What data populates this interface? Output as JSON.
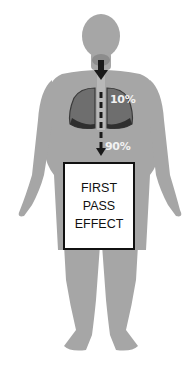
{
  "diagram": {
    "colors": {
      "body": "#a6a6a6",
      "lungs": "#6e6e6e",
      "lung_outline": "#3a3a3a",
      "arrow": "#1a1a1a",
      "label_text": "#f2f2f2",
      "box_border": "#111111"
    },
    "labels": {
      "lung_percentage": "10%",
      "gut_percentage": "90%"
    },
    "box": {
      "lines": [
        "FIRST",
        "PASS",
        "EFFECT"
      ]
    }
  }
}
